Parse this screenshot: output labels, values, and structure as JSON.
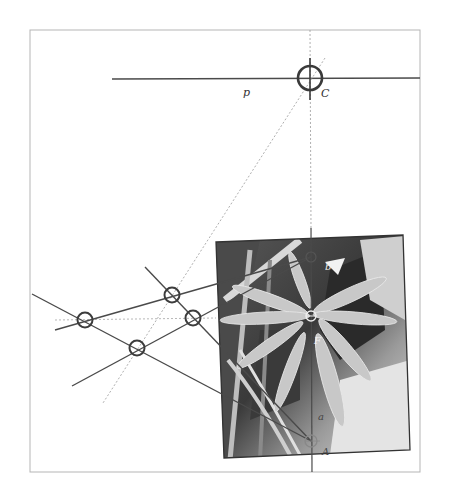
{
  "figure": {
    "type": "perspective-construction-diagram",
    "frame": {
      "x": 30,
      "y": 30,
      "width": 390,
      "height": 442
    },
    "colors": {
      "line": "#4a4a4a",
      "dashed": "#9a9a9a",
      "frame": "#b5b5b5",
      "circle": "#3c3c3c",
      "photo_dark": "#2e2e2e",
      "photo_mid": "#7a7a7a",
      "photo_light": "#e2e2e2"
    }
  },
  "labels": {
    "p": "p",
    "C": "C",
    "b": "b",
    "F": "F",
    "a": "a",
    "A": "A"
  },
  "points": {
    "C": {
      "x": 310,
      "y": 78
    },
    "b": {
      "x": 311,
      "y": 257
    },
    "F": {
      "x": 311,
      "y": 316
    },
    "A": {
      "x": 311,
      "y": 441
    },
    "left_circles": [
      {
        "x": 85,
        "y": 320
      },
      {
        "x": 172,
        "y": 295
      },
      {
        "x": 193,
        "y": 318
      },
      {
        "x": 137,
        "y": 348
      }
    ]
  },
  "photo": {
    "description": "grayscale photo of radiating leaves (plant rosette)",
    "corners": [
      [
        216,
        242
      ],
      [
        403,
        235
      ],
      [
        410,
        450
      ],
      [
        224,
        458
      ]
    ]
  }
}
